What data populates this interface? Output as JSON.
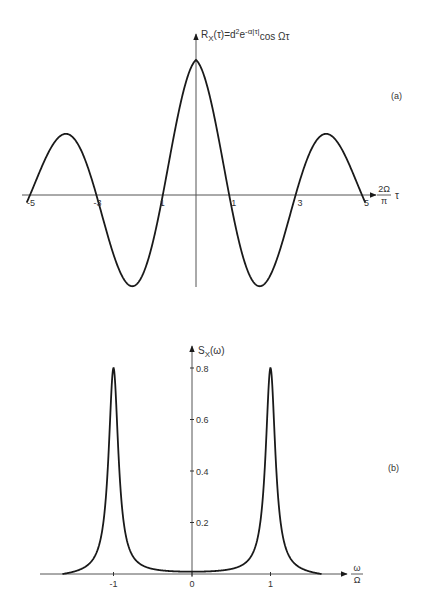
{
  "figure": {
    "panel_a_label": "(a)",
    "panel_b_label": "(b)"
  },
  "chart_data": [
    {
      "type": "line",
      "panel": "(a)",
      "title": "R_X(τ) = d²e^{-α|τ|} cos Ωτ",
      "ylabel": {
        "main": "R",
        "sub": "X",
        "rest": "(τ)=d",
        "sup1": "2",
        "e": "e",
        "sup2": "-α|τ|",
        "tail": "cos Ωτ"
      },
      "xlabel": {
        "num": "2Ω",
        "den": "π",
        "var": "τ"
      },
      "x_ticks": [
        -5,
        -3,
        -1,
        1,
        3,
        5
      ],
      "x_tick_labels": [
        "-5",
        "-3",
        "1",
        "1",
        "3",
        "5"
      ],
      "function": "exp(-k|u|) * cos(pi*u/2)",
      "params": {
        "k": 0.2
      },
      "xlim": [
        -5.1,
        5.1
      ],
      "key_points": [
        {
          "x": -5,
          "y": 0
        },
        {
          "x": -4,
          "y": 0.45
        },
        {
          "x": -3,
          "y": 0
        },
        {
          "x": -2,
          "y": -0.62
        },
        {
          "x": -1,
          "y": 0
        },
        {
          "x": 0,
          "y": 1.0
        },
        {
          "x": 1,
          "y": 0
        },
        {
          "x": 2,
          "y": -0.62
        },
        {
          "x": 3,
          "y": 0
        },
        {
          "x": 4,
          "y": 0.45
        },
        {
          "x": 5,
          "y": 0
        }
      ],
      "grid": false
    },
    {
      "type": "line",
      "panel": "(b)",
      "title": "S_X(ω)",
      "ylabel": {
        "main": "S",
        "sub": "X",
        "rest": "(ω)"
      },
      "xlabel": {
        "num": "ω",
        "den": "Ω"
      },
      "x_ticks": [
        -1,
        0,
        1
      ],
      "x_tick_labels": [
        "-1",
        "0",
        "1"
      ],
      "y_ticks": [
        0.2,
        0.4,
        0.6,
        0.8
      ],
      "y_tick_labels": [
        "0.2",
        "0.4",
        "0.6",
        "0.8"
      ],
      "ylim": [
        0,
        0.85
      ],
      "xlim": [
        -1.65,
        1.65
      ],
      "function": "Lorentzian pair centered at ±1",
      "params": {
        "peak": 0.8,
        "width": 0.075
      },
      "key_points": [
        {
          "x": -1.65,
          "y": 0.0
        },
        {
          "x": -1,
          "y": 0.8
        },
        {
          "x": 0,
          "y": 0.01
        },
        {
          "x": 1,
          "y": 0.8
        },
        {
          "x": 1.65,
          "y": 0.0
        }
      ],
      "grid": false
    }
  ]
}
